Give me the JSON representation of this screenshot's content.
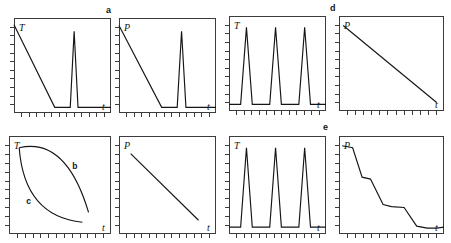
{
  "figure": {
    "background": "#ffffff",
    "line_color": "#151515",
    "frame_color": "#3c3c3c",
    "panel_letters": [
      {
        "label": "a",
        "x": 106,
        "y": 6
      },
      {
        "label": "d",
        "x": 330,
        "y": 4
      },
      {
        "label": "e",
        "x": 323,
        "y": 123
      }
    ],
    "axis_labels": {
      "temperature": "T",
      "pressure": "P",
      "time": "t"
    },
    "curve_labels": {
      "b": "b",
      "c": "c"
    }
  },
  "chart_data": {
    "type": "line",
    "title": "",
    "grid": false,
    "legend": "none",
    "panels": [
      {
        "id": "panel-1",
        "row": 1,
        "col": 1,
        "ylabel": "T",
        "xlabel": "t",
        "panel_letter": "a",
        "description": "temperature ramps down linearly then a single sharp spike",
        "x": [
          0,
          0.42,
          0.58,
          0.62,
          0.66,
          0.7,
          1.0
        ],
        "y": [
          0.93,
          0.06,
          0.06,
          0.86,
          0.06,
          0.06,
          0.06
        ],
        "xlim": [
          0,
          1
        ],
        "ylim": [
          0,
          1
        ]
      },
      {
        "id": "panel-2",
        "row": 1,
        "col": 2,
        "ylabel": "P",
        "xlabel": "t",
        "panel_letter": "",
        "description": "pressure ramps down linearly then a single sharp spike",
        "x": [
          0,
          0.44,
          0.6,
          0.645,
          0.69,
          0.73,
          1.0
        ],
        "y": [
          0.92,
          0.06,
          0.06,
          0.86,
          0.06,
          0.06,
          0.06
        ],
        "xlim": [
          0,
          1
        ],
        "ylim": [
          0,
          1
        ]
      },
      {
        "id": "panel-3",
        "row": 1,
        "col": 3,
        "ylabel": "T",
        "xlabel": "t",
        "panel_letter": "",
        "description": "three identical sharp temperature pulses",
        "x": [
          0,
          0.12,
          0.18,
          0.24,
          0.42,
          0.48,
          0.54,
          0.72,
          0.78,
          0.84,
          1.0
        ],
        "y": [
          0.07,
          0.07,
          0.88,
          0.07,
          0.07,
          0.88,
          0.07,
          0.07,
          0.88,
          0.07,
          0.07
        ],
        "xlim": [
          0,
          1
        ],
        "ylim": [
          0,
          1
        ]
      },
      {
        "id": "panel-4",
        "row": 1,
        "col": 4,
        "ylabel": "P",
        "xlabel": "t",
        "panel_letter": "d",
        "description": "pressure decreases linearly over the whole interval",
        "x": [
          0.04,
          0.93
        ],
        "y": [
          0.9,
          0.09
        ],
        "xlim": [
          0,
          1
        ],
        "ylim": [
          0,
          1
        ]
      },
      {
        "id": "panel-5",
        "row": 2,
        "col": 1,
        "ylabel": "T",
        "xlabel": "t",
        "panel_letter": "",
        "description": "two arcs forming a lens: upper arc b from top-left to bottom-right, lower arc c from top-left to bottom-right",
        "curves": [
          {
            "name": "b",
            "label": "b",
            "shape": "arc-concave-down",
            "points": [
              [
                0.1,
                0.88
              ],
              [
                0.5,
                0.77
              ],
              [
                0.78,
                0.22
              ]
            ]
          },
          {
            "name": "c",
            "label": "c",
            "shape": "arc-concave-up",
            "points": [
              [
                0.1,
                0.88
              ],
              [
                0.28,
                0.34
              ],
              [
                0.72,
                0.12
              ]
            ]
          }
        ],
        "xlim": [
          0,
          1
        ],
        "ylim": [
          0,
          1
        ]
      },
      {
        "id": "panel-6",
        "row": 2,
        "col": 2,
        "ylabel": "P",
        "xlabel": "t",
        "panel_letter": "",
        "description": "pressure decreases linearly over the whole interval",
        "x": [
          0.12,
          0.82
        ],
        "y": [
          0.82,
          0.14
        ],
        "xlim": [
          0,
          1
        ],
        "ylim": [
          0,
          1
        ]
      },
      {
        "id": "panel-7",
        "row": 2,
        "col": 3,
        "ylabel": "T",
        "xlabel": "t",
        "panel_letter": "",
        "description": "three identical sharp temperature pulses",
        "x": [
          0,
          0.12,
          0.18,
          0.24,
          0.42,
          0.48,
          0.54,
          0.72,
          0.78,
          0.84,
          1.0
        ],
        "y": [
          0.07,
          0.07,
          0.88,
          0.07,
          0.07,
          0.88,
          0.07,
          0.07,
          0.88,
          0.07,
          0.07
        ],
        "xlim": [
          0,
          1
        ],
        "ylim": [
          0,
          1
        ]
      },
      {
        "id": "panel-8",
        "row": 2,
        "col": 4,
        "ylabel": "P",
        "xlabel": "t",
        "panel_letter": "e",
        "description": "pressure falls in a descending staircase of four steps",
        "x": [
          0.03,
          0.13,
          0.22,
          0.3,
          0.42,
          0.5,
          0.62,
          0.74,
          0.84,
          0.93,
          1.0
        ],
        "y": [
          0.9,
          0.88,
          0.58,
          0.56,
          0.3,
          0.28,
          0.27,
          0.08,
          0.06,
          0.06,
          0.07
        ],
        "xlim": [
          0,
          1
        ],
        "ylim": [
          0,
          1
        ]
      }
    ]
  }
}
